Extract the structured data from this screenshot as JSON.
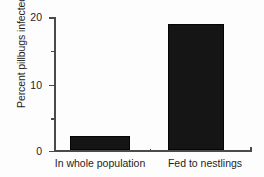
{
  "chart_data": {
    "type": "bar",
    "title": "",
    "xlabel": "",
    "ylabel": "Percent pillbugs infected",
    "categories": [
      "In whole population",
      "Fed to nestlings"
    ],
    "values": [
      2.1,
      18.9
    ],
    "ylim": [
      0,
      20
    ],
    "y_major_ticks": [
      0,
      10,
      20
    ],
    "y_major_tick_labels": [
      "0",
      "10",
      "20"
    ],
    "y_minor_ticks": [
      5,
      15
    ],
    "grid": false,
    "legend": null,
    "bar_color": "#151515",
    "axis_color": "#4a4a4a",
    "text_color": "#1d1d1d",
    "background": "#fdfdfd"
  }
}
